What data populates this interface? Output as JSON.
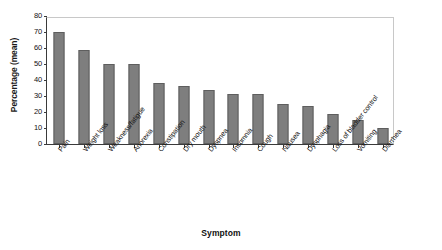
{
  "figure": {
    "background_color": "#ffffff",
    "bar_color": "#7e7e7e",
    "bar_border_color": "#5e5e5e",
    "axis_color": "#3a3a3a"
  },
  "chart_data": {
    "type": "bar",
    "title": "",
    "xlabel": "Symptom",
    "ylabel": "Percentage (mean)",
    "ylim": [
      0,
      80
    ],
    "yticks": [
      0,
      10,
      20,
      30,
      40,
      50,
      60,
      70,
      80
    ],
    "grid": false,
    "legend": null,
    "categories": [
      "Pain",
      "Weight loss",
      "Weakness/fatigue",
      "Anorexia",
      "Constipation",
      "Dry mouth",
      "Dyspnea",
      "Insomnia",
      "Cough",
      "Nausea",
      "Dysphagia",
      "Loss of bladder control",
      "Vomiting",
      "Diarrhea"
    ],
    "values": [
      70,
      59,
      50,
      50,
      38,
      36,
      34,
      31,
      31,
      25,
      24,
      19,
      15,
      10
    ]
  }
}
